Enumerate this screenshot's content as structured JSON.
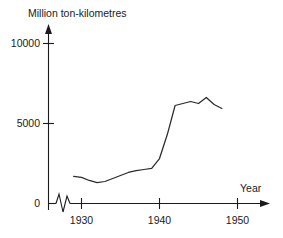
{
  "chart_data": {
    "type": "line",
    "title": "Million ton-kilometres",
    "xlabel": "Year",
    "ylabel": "Million ton-kilometres",
    "xlim": [
      1928,
      1953
    ],
    "ylim": [
      0,
      10625
    ],
    "grid": false,
    "legend": null,
    "x_ticks": [
      1930,
      1940,
      1950
    ],
    "x_tick_labels": [
      "1930",
      "1940",
      "1950"
    ],
    "y_ticks": [
      0,
      5000,
      10000
    ],
    "y_tick_labels": [
      "0",
      "5000",
      "10000"
    ],
    "axis_break": true,
    "axis_break_note": "zigzag break on x-axis just right of origin",
    "x": [
      1929.0,
      1930.0,
      1931.0,
      1932.0,
      1933.0,
      1934.0,
      1935.0,
      1936.0,
      1937.0,
      1938.0,
      1939.0,
      1940.0,
      1941.0,
      1942.0,
      1943.0,
      1944.0,
      1945.0,
      1946.0,
      1947.0,
      1948.0
    ],
    "values": [
      1690,
      1630,
      1440,
      1310,
      1375,
      1560,
      1750,
      1940,
      2060,
      2125,
      2190,
      2810,
      4310,
      6125,
      6250,
      6375,
      6250,
      6625,
      6190,
      5940
    ],
    "annotations": []
  },
  "axis_labels": {
    "y_title": "Million ton-kilometres",
    "x_title": "Year",
    "y_10000": "10000",
    "y_5000": "5000",
    "y_0": "0",
    "x_1930": "1930",
    "x_1940": "1940",
    "x_1950": "1950"
  },
  "colors": {
    "line": "#2b2b2b",
    "axis": "#1a1a1a",
    "background": "#ffffff"
  }
}
